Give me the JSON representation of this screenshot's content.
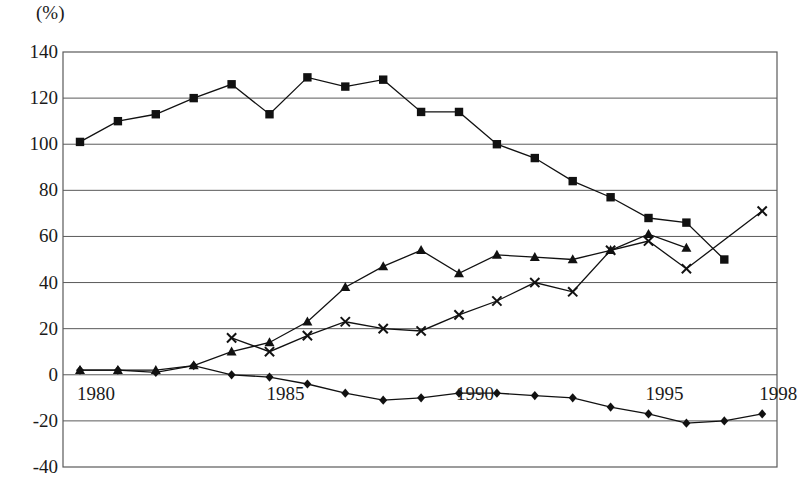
{
  "chart_data": {
    "type": "line",
    "title": "",
    "subtitle": "",
    "xlabel": "",
    "ylabel": "(%)",
    "unit_label": "(%)",
    "x": [
      1980,
      1981,
      1982,
      1983,
      1984,
      1985,
      1986,
      1987,
      1988,
      1989,
      1990,
      1991,
      1992,
      1993,
      1994,
      1995,
      1996,
      1997,
      1998
    ],
    "xlim": [
      1980,
      1998
    ],
    "ylim": [
      -40,
      140
    ],
    "ytick_labels": [
      "140",
      "120",
      "100",
      "80",
      "60",
      "40",
      "20",
      "0",
      "-20",
      "-40"
    ],
    "ytick_values": [
      140,
      120,
      100,
      80,
      60,
      40,
      20,
      0,
      -20,
      -40
    ],
    "xtick_labels": [
      "1980",
      "1985",
      "1990",
      "1995",
      "1998"
    ],
    "xtick_values": [
      1980,
      1985,
      1990,
      1995,
      1998
    ],
    "grid": true,
    "grid_axis": "y",
    "legend": "none",
    "legend_position": "none",
    "series": [
      {
        "name": "series-square",
        "marker": "square",
        "color": "#111111",
        "x": [
          1980,
          1981,
          1982,
          1983,
          1984,
          1985,
          1986,
          1987,
          1988,
          1989,
          1990,
          1991,
          1992,
          1993,
          1994,
          1995,
          1996,
          1997
        ],
        "values": [
          101,
          110,
          113,
          120,
          126,
          113,
          129,
          125,
          128,
          114,
          114,
          100,
          94,
          84,
          77,
          68,
          66,
          50
        ]
      },
      {
        "name": "series-triangle",
        "marker": "triangle",
        "color": "#111111",
        "x": [
          1980,
          1981,
          1982,
          1983,
          1984,
          1985,
          1986,
          1987,
          1988,
          1989,
          1990,
          1991,
          1992,
          1993,
          1994,
          1995,
          1996
        ],
        "values": [
          2,
          2,
          2,
          4,
          10,
          14,
          23,
          38,
          47,
          54,
          44,
          52,
          51,
          50,
          54,
          61,
          55
        ]
      },
      {
        "name": "series-cross",
        "marker": "cross",
        "color": "#111111",
        "x": [
          1984,
          1985,
          1986,
          1987,
          1988,
          1989,
          1990,
          1991,
          1992,
          1993,
          1994,
          1995,
          1996,
          1998
        ],
        "values": [
          16,
          10,
          17,
          23,
          20,
          19,
          26,
          32,
          40,
          36,
          54,
          58,
          46,
          71
        ]
      },
      {
        "name": "series-diamond",
        "marker": "diamond",
        "color": "#111111",
        "x": [
          1980,
          1981,
          1982,
          1983,
          1984,
          1985,
          1986,
          1987,
          1988,
          1989,
          1990,
          1991,
          1992,
          1993,
          1994,
          1995,
          1996,
          1997,
          1998
        ],
        "values": [
          2,
          2,
          1,
          4,
          0,
          -1,
          -4,
          -8,
          -11,
          -10,
          -8,
          -8,
          -9,
          -10,
          -14,
          -17,
          -21,
          -20,
          -17
        ]
      }
    ]
  },
  "geometry": {
    "plot_left": 63,
    "plot_right": 777,
    "plot_top": 52,
    "plot_bottom": 467,
    "x_first": 80,
    "x_step": 37.9
  }
}
